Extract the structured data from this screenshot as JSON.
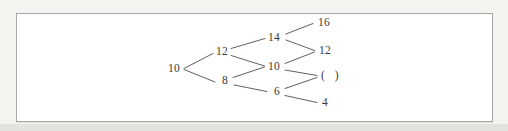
{
  "diagram": {
    "type": "number-lattice-tree",
    "nodes": [
      {
        "id": "L1-a",
        "level": 1,
        "value": "10"
      },
      {
        "id": "L2-a",
        "level": 2,
        "value": "12"
      },
      {
        "id": "L2-b",
        "level": 2,
        "value": "8"
      },
      {
        "id": "L3-a",
        "level": 3,
        "value": "14"
      },
      {
        "id": "L3-b",
        "level": 3,
        "value": "10"
      },
      {
        "id": "L3-c",
        "level": 3,
        "value": "6"
      },
      {
        "id": "L4-a",
        "level": 4,
        "value": "16"
      },
      {
        "id": "L4-b",
        "level": 4,
        "value": "12"
      },
      {
        "id": "L4-c",
        "level": 4,
        "value": "(   )",
        "blank": true
      },
      {
        "id": "L4-d",
        "level": 4,
        "value": "4"
      }
    ],
    "edges": [
      {
        "from": "L1-a",
        "to": "L2-a"
      },
      {
        "from": "L1-a",
        "to": "L2-b"
      },
      {
        "from": "L2-a",
        "to": "L3-a"
      },
      {
        "from": "L2-a",
        "to": "L3-b"
      },
      {
        "from": "L2-b",
        "to": "L3-b"
      },
      {
        "from": "L2-b",
        "to": "L3-c"
      },
      {
        "from": "L3-a",
        "to": "L4-a"
      },
      {
        "from": "L3-a",
        "to": "L4-b"
      },
      {
        "from": "L3-b",
        "to": "L4-b"
      },
      {
        "from": "L3-b",
        "to": "L4-c"
      },
      {
        "from": "L3-c",
        "to": "L4-c"
      },
      {
        "from": "L3-c",
        "to": "L4-d"
      }
    ],
    "colors": {
      "line": "#4d4d4d",
      "text": "#3a3a3a",
      "frame_border": "#a6a6a6",
      "frame_background": "#ffffff",
      "page_background": "#f4f3f0"
    }
  }
}
